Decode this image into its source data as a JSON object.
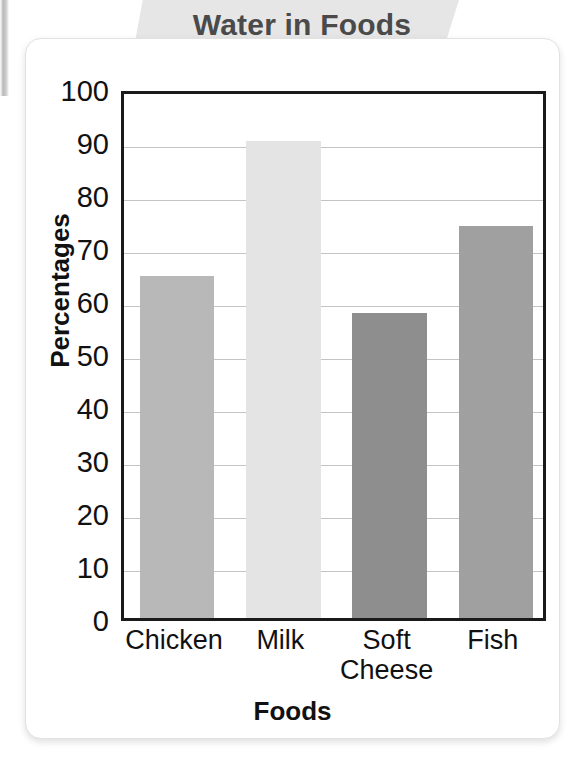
{
  "banner": {
    "title": "Water in Foods"
  },
  "axes": {
    "y_title": "Percentages",
    "x_title": "Foods",
    "y_ticks": [
      "100",
      "90",
      "80",
      "70",
      "60",
      "50",
      "40",
      "30",
      "20",
      "10",
      "0"
    ]
  },
  "chart_data": {
    "type": "bar",
    "title": "Water in Foods",
    "xlabel": "Foods",
    "ylabel": "Percentages",
    "categories": [
      "Chicken",
      "Milk",
      "Soft\nCheese",
      "Fish"
    ],
    "values": [
      64.5,
      90,
      57.5,
      74
    ],
    "ylim": [
      0,
      100
    ],
    "ytick_step": 10,
    "grid": true,
    "legend": "none",
    "bar_colors": [
      "#b8b8b8",
      "#e4e4e4",
      "#8e8e8e",
      "#a0a0a0"
    ]
  }
}
